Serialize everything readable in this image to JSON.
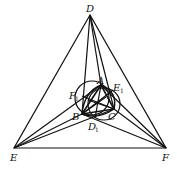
{
  "figure": {
    "points": {
      "D": {
        "label": "D",
        "x": 90,
        "y": 15
      },
      "E": {
        "label": "E",
        "x": 14,
        "y": 148
      },
      "F": {
        "label": "F",
        "x": 166,
        "y": 148
      },
      "A": {
        "label": "A",
        "x": 101,
        "y": 85
      },
      "B": {
        "label": "B",
        "x": 82,
        "y": 114
      },
      "C": {
        "label": "C",
        "x": 114,
        "y": 109
      },
      "E1": {
        "label": "E",
        "sub": "1",
        "x": 113,
        "y": 90
      },
      "F1": {
        "label": "F",
        "sub": "1",
        "x": 82,
        "y": 96
      },
      "D1": {
        "label": "D",
        "sub": "1",
        "x": 95,
        "y": 118
      }
    },
    "colors": {
      "stroke": "#111111",
      "background": "#ffffff"
    }
  }
}
